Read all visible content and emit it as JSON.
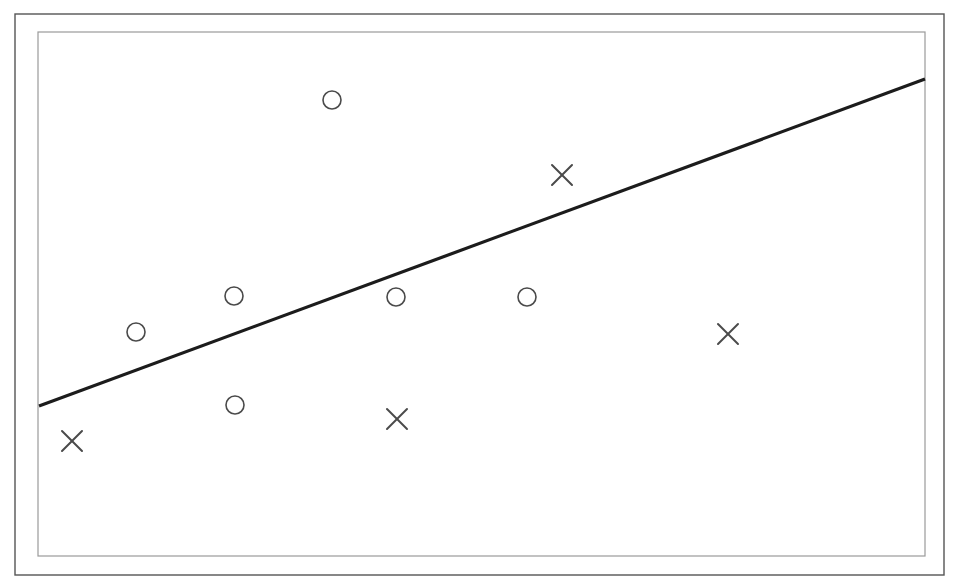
{
  "figure": {
    "kind": "scatter-plot-with-decision-boundary",
    "width": 957,
    "height": 587,
    "background_color": "#ffffff"
  },
  "frame": {
    "outer": {
      "x": 15,
      "y": 14,
      "width": 929,
      "height": 561,
      "stroke_color": "#555555",
      "stroke_width": 1.4
    },
    "inner": {
      "x": 38,
      "y": 32,
      "width": 887,
      "height": 524,
      "stroke_color": "#9a9a9a",
      "stroke_width": 1.2
    }
  },
  "chart_data": {
    "type": "scatter",
    "title": "",
    "subtitle": "",
    "xlabel": "",
    "ylabel": "",
    "xlim": [
      38,
      925
    ],
    "ylim": [
      32,
      556
    ],
    "grid": false,
    "axis_ticks": false,
    "legend": {
      "visible": false,
      "position": "none",
      "entries": [
        {
          "name": "circle-class",
          "marker": "circle",
          "label": "O"
        },
        {
          "name": "cross-class",
          "marker": "cross",
          "label": "X"
        }
      ]
    },
    "series": [
      {
        "name": "circle-class",
        "marker": "circle",
        "marker_radius": 9,
        "stroke_color": "#4a4a4a",
        "stroke_width": 1.6,
        "fill": "none",
        "count": 6,
        "points": [
          {
            "x": 332,
            "y": 100
          },
          {
            "x": 136,
            "y": 332
          },
          {
            "x": 234,
            "y": 296
          },
          {
            "x": 396,
            "y": 297
          },
          {
            "x": 527,
            "y": 297
          },
          {
            "x": 235,
            "y": 405
          }
        ]
      },
      {
        "name": "cross-class",
        "marker": "cross",
        "marker_size": 20,
        "stroke_color": "#4a4a4a",
        "stroke_width": 2.0,
        "fill": "none",
        "count": 4,
        "points": [
          {
            "x": 562,
            "y": 175
          },
          {
            "x": 728,
            "y": 334
          },
          {
            "x": 397,
            "y": 419
          },
          {
            "x": 72,
            "y": 441
          }
        ]
      }
    ],
    "annotations": [
      {
        "name": "decision-boundary",
        "type": "line",
        "x1": 39,
        "y1": 406,
        "x2": 925,
        "y2": 79,
        "stroke_color": "#1c1c1c",
        "stroke_width": 3.2,
        "label": ""
      }
    ]
  }
}
